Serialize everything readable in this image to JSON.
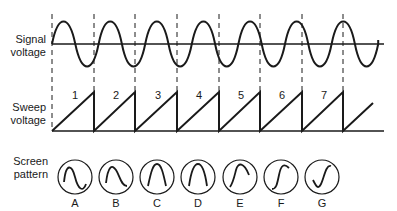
{
  "labels": {
    "signal": [
      "Signal",
      "voltage"
    ],
    "sweep": [
      "Sweep",
      "voltage"
    ],
    "screen": [
      "Screen",
      "pattern"
    ]
  },
  "sweep_numbers": [
    "1",
    "2",
    "3",
    "4",
    "5",
    "6",
    "7"
  ],
  "screen_letters": [
    "A",
    "B",
    "C",
    "D",
    "E",
    "F",
    "G"
  ],
  "colors": {
    "ink": "#1a1a1a",
    "background": "#ffffff"
  }
}
